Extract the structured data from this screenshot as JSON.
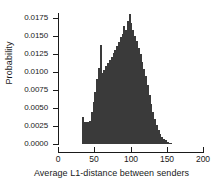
{
  "chart_data": {
    "type": "bar",
    "title": "",
    "xlabel": "Average L1-distance between senders",
    "ylabel": "Probability",
    "xlim": [
      0,
      200
    ],
    "ylim": [
      0,
      0.018
    ],
    "grid": false,
    "legend": null,
    "bar_color": "#3a3a3a",
    "axis_color": "#1a1a1a",
    "background": "#ffffff",
    "bin_width": 2.5,
    "xticks": [
      0,
      50,
      100,
      150,
      200
    ],
    "xtick_labels": [
      "0",
      "50",
      "100",
      "150",
      "200"
    ],
    "yticks": [
      0.0,
      0.0025,
      0.005,
      0.0075,
      0.01,
      0.0125,
      0.015,
      0.0175
    ],
    "ytick_labels": [
      "0.0000",
      "0.0025",
      "0.0050",
      "0.0075",
      "0.0100",
      "0.0125",
      "0.0150",
      "0.0175"
    ],
    "categories": [
      34.0,
      36.5,
      39.0,
      41.5,
      44.0,
      46.5,
      49.0,
      51.5,
      54.0,
      56.5,
      59.0,
      61.5,
      64.0,
      66.5,
      69.0,
      71.5,
      74.0,
      76.5,
      79.0,
      81.5,
      84.0,
      86.5,
      89.0,
      91.5,
      94.0,
      96.5,
      99.0,
      101.5,
      104.0,
      106.5,
      109.0,
      111.5,
      114.0,
      116.5,
      119.0,
      121.5,
      124.0,
      126.5,
      129.0,
      131.5,
      134.0,
      136.5,
      139.0,
      141.5,
      144.0,
      146.5,
      149.0,
      151.5,
      154.0,
      156.5
    ],
    "values": [
      0.0038,
      0.003,
      0.003,
      0.0031,
      0.0032,
      0.0045,
      0.0058,
      0.0072,
      0.009,
      0.0105,
      0.0137,
      0.0098,
      0.0102,
      0.0108,
      0.0112,
      0.0116,
      0.0121,
      0.0126,
      0.013,
      0.0136,
      0.0141,
      0.0148,
      0.0152,
      0.0163,
      0.0158,
      0.017,
      0.018,
      0.0168,
      0.0158,
      0.015,
      0.0142,
      0.0133,
      0.0124,
      0.0114,
      0.0104,
      0.0094,
      0.0082,
      0.0068,
      0.0055,
      0.0044,
      0.0035,
      0.0026,
      0.0019,
      0.0014,
      0.001,
      0.0007,
      0.0005,
      0.0003,
      0.0002,
      0.0001
    ]
  }
}
